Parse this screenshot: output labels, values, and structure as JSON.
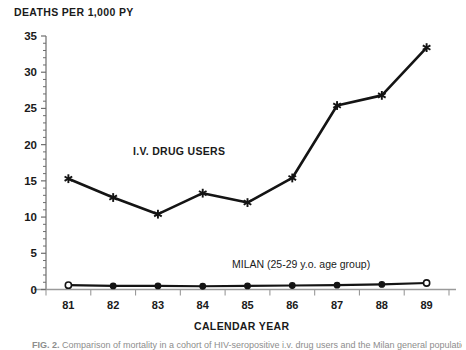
{
  "figure": {
    "caption_label": "FIG. 2.",
    "caption_text": "Comparison of mortality in a cohort of HIV-seropositive i.v. drug users and the Milan general population"
  },
  "axes": {
    "y_axis_title": "DEATHS PER 1,000 PY",
    "x_axis_title": "CALENDAR YEAR",
    "y_ticks": [
      "0",
      "5",
      "10",
      "15",
      "20",
      "25",
      "30",
      "35"
    ],
    "x_ticks": [
      "81",
      "82",
      "83",
      "84",
      "85",
      "86",
      "87",
      "88",
      "89"
    ]
  },
  "annotations": {
    "series1_label": "I.V. DRUG USERS",
    "series2_label": "MILAN (25-29 y.o. age group)"
  },
  "colors": {
    "ink": "#141414",
    "axis": "#6d6d6d",
    "background": "#ffffff"
  },
  "chart_data": {
    "type": "line",
    "title": "",
    "xlabel": "CALENDAR YEAR",
    "ylabel": "DEATHS PER 1,000 PY",
    "x": [
      "81",
      "82",
      "83",
      "84",
      "85",
      "86",
      "87",
      "88",
      "89"
    ],
    "xlim": [
      80.5,
      89.5
    ],
    "ylim": [
      0,
      35
    ],
    "ytick_step": 5,
    "yminor_step": 1,
    "grid": false,
    "legend": "inline-annotations",
    "series": [
      {
        "name": "I.V. DRUG USERS",
        "marker": "asterisk",
        "values": [
          15.3,
          12.7,
          10.4,
          13.3,
          12.0,
          15.4,
          25.4,
          26.8,
          33.4
        ]
      },
      {
        "name": "MILAN (25-29 y.o. age group)",
        "marker": "circle",
        "values": [
          0.6,
          0.5,
          0.5,
          0.45,
          0.5,
          0.55,
          0.6,
          0.7,
          0.9
        ]
      }
    ]
  }
}
